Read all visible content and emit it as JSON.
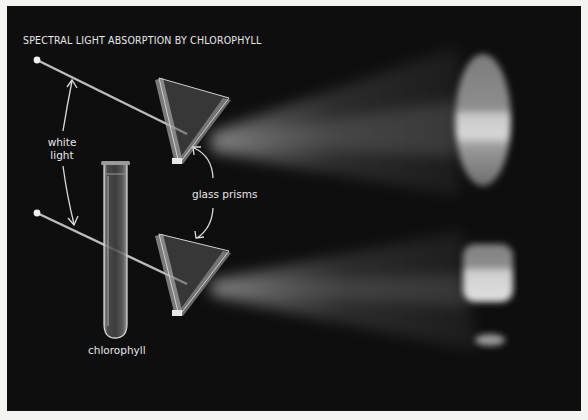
{
  "figure": {
    "title": "SPECTRAL LIGHT ABSORPTION BY CHLOROPHYLL",
    "labels": {
      "white_light_line1": "white",
      "white_light_line2": "light",
      "glass_prisms": "glass prisms",
      "chlorophyll": "chlorophyll"
    },
    "elements": [
      {
        "name": "light-source-top",
        "icon": "point-dot-icon"
      },
      {
        "name": "light-source-bottom",
        "icon": "point-dot-icon"
      },
      {
        "name": "prism-top",
        "icon": "triangular-prism-icon"
      },
      {
        "name": "prism-bottom",
        "icon": "triangular-prism-icon"
      },
      {
        "name": "test-tube",
        "icon": "test-tube-icon"
      },
      {
        "name": "spectrum-top",
        "description": "full continuous spectrum"
      },
      {
        "name": "spectrum-bottom",
        "description": "spectrum with absorption gap after chlorophyll"
      }
    ],
    "colors": {
      "background": "#0e0e0e",
      "page": "#f4f4f2",
      "text": "#e8e8e8"
    }
  }
}
